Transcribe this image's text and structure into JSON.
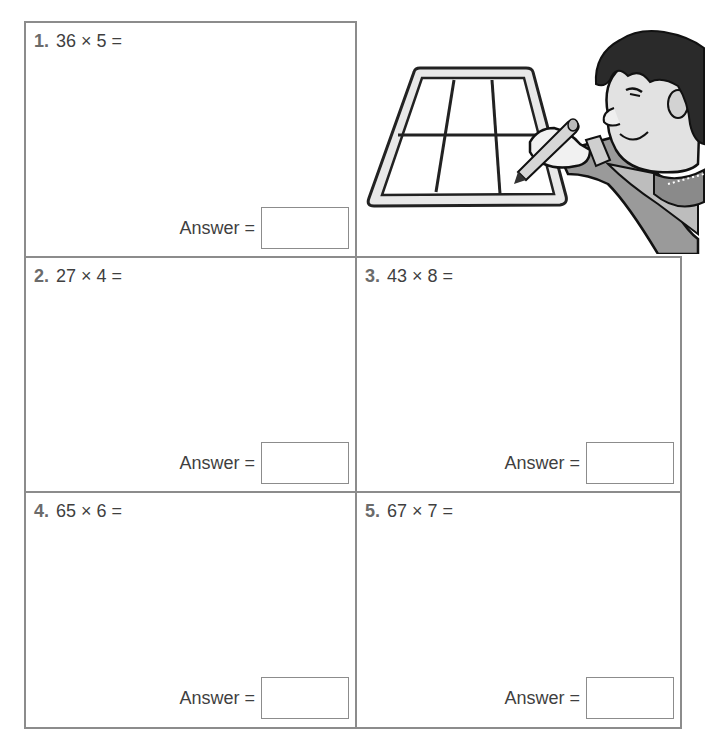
{
  "worksheet": {
    "answer_label": "Answer =",
    "problems": [
      {
        "number": "1.",
        "expression": "36 × 5 ="
      },
      {
        "number": "2.",
        "expression": "27 × 4 ="
      },
      {
        "number": "3.",
        "expression": "43 × 8 ="
      },
      {
        "number": "4.",
        "expression": "65 × 6 ="
      },
      {
        "number": "5.",
        "expression": "67 × 7 ="
      }
    ],
    "illustration": "boy-drawing-grid-on-tablet"
  }
}
